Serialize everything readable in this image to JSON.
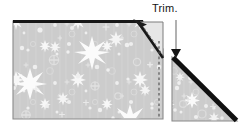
{
  "figure": {
    "background_color": "#ffffff",
    "annotations": [
      {
        "id": "trim",
        "label": "Trim.",
        "arrow": "down-arrow-icon",
        "arrow_color": "#9b9b9b",
        "arrow_x": 176,
        "arrow_top_y": 20,
        "arrow_tip_y": 57
      }
    ],
    "shapes": [
      {
        "id": "main-fabric-piece",
        "name": "fabric-panel-left",
        "fill_color": "#cccccc",
        "pattern": "star-print-fabric",
        "outline_color": "#8a8a8a",
        "top_edge_color": "#1a1a1a",
        "top_edge_weight": 3,
        "points": "13,21 143,21 163,49 163,119 13,119"
      },
      {
        "id": "folded-corner-flap",
        "name": "folded-corner-flap",
        "fill_color": "#e3e3e3",
        "outline_color": "#6f6f6f",
        "fold_line_color": "#1a1a1a",
        "fold_dash_color": "#7a7a7a",
        "points": "139,22 163,22 163,58"
      },
      {
        "id": "trimmed-triangle",
        "name": "fabric-triangle-right",
        "fill_color": "#cbcbcb",
        "pattern": "star-print-fabric",
        "outline_color": "#8a8a8a",
        "bias_edge_color": "#121212",
        "bias_edge_weight": 5,
        "points": "172,57 172,121 237,121"
      }
    ],
    "guides": [
      {
        "id": "cut-line",
        "name": "dashed-cut-line",
        "style": "dashed",
        "color": "#5a5a5a",
        "x": 159,
        "y1": 42,
        "y2": 119
      }
    ],
    "fabric_pattern": {
      "name": "star-print-fabric",
      "base_color": "#cccccc",
      "stripe_color": "#d4d4d4",
      "motif_color": "#f6f6f6",
      "motif_faint_color": "#dcdcdc",
      "motif": "starburst"
    }
  }
}
